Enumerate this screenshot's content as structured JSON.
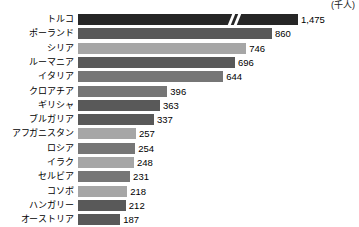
{
  "unit_label": "(千人)",
  "colors": {
    "near_black": "#262626",
    "dark_gray": "#595959",
    "mid_gray": "#767676",
    "light_gray": "#a6a6a6",
    "background": "#ffffff",
    "text": "#000000"
  },
  "chart_data": {
    "type": "bar",
    "orientation": "horizontal",
    "title": "",
    "subtitle": "",
    "xlabel": "",
    "ylabel": "",
    "unit": "千人",
    "grid": false,
    "legend": false,
    "axis_break": true,
    "axis_break_note": "先頭の棒に軸の省略記号（二重斜線）あり",
    "xlim": [
      0,
      1000
    ],
    "categories": [
      "トルコ",
      "ポーランド",
      "シリア",
      "ルーマニア",
      "イタリア",
      "クロアチア",
      "ギリシャ",
      "ブルガリア",
      "アフガニスタン",
      "ロシア",
      "イラク",
      "セルビア",
      "コソボ",
      "ハンガリー",
      "オーストリア"
    ],
    "values": [
      1475,
      860,
      746,
      696,
      644,
      396,
      363,
      337,
      257,
      254,
      248,
      231,
      218,
      212,
      187
    ],
    "value_labels": [
      "1,475",
      "860",
      "746",
      "696",
      "644",
      "396",
      "363",
      "337",
      "257",
      "254",
      "248",
      "231",
      "218",
      "212",
      "187"
    ],
    "bar_colors": [
      "#262626",
      "#595959",
      "#a6a6a6",
      "#595959",
      "#767676",
      "#767676",
      "#595959",
      "#595959",
      "#a6a6a6",
      "#767676",
      "#a6a6a6",
      "#767676",
      "#a6a6a6",
      "#595959",
      "#595959"
    ]
  }
}
